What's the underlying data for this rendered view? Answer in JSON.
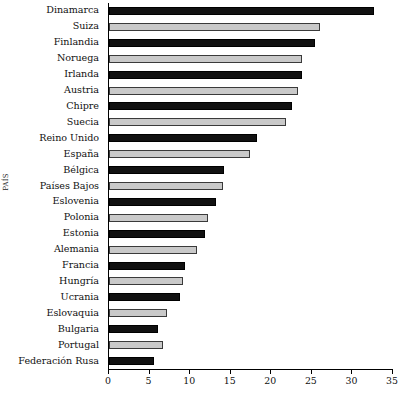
{
  "chart_data": {
    "type": "bar",
    "orientation": "horizontal",
    "title": "",
    "xlabel": "",
    "ylabel": "PAÍS",
    "xlim": [
      0,
      35
    ],
    "ylim": null,
    "grid": false,
    "legend": null,
    "xticks": [
      0,
      5,
      10,
      15,
      20,
      25,
      30,
      35
    ],
    "xtick_labels": [
      "0",
      "5",
      "10",
      "15",
      "20",
      "25",
      "30",
      "35"
    ],
    "categories": [
      "Dinamarca",
      "Suiza",
      "Finlandia",
      "Noruega",
      "Irlanda",
      "Austria",
      "Chipre",
      "Suecia",
      "Reino Unido",
      "España",
      "Bélgica",
      "Países Bajos",
      "Eslovenia",
      "Polonia",
      "Estonia",
      "Alemania",
      "Francia",
      "Hungría",
      "Ucrania",
      "Eslovaquia",
      "Bulgaria",
      "Portugal",
      "Federación Rusa"
    ],
    "values": [
      32.7,
      26.0,
      25.4,
      23.8,
      23.8,
      23.3,
      22.5,
      21.8,
      18.3,
      17.4,
      14.2,
      14.1,
      13.2,
      12.2,
      11.8,
      10.8,
      9.4,
      9.1,
      8.7,
      7.1,
      6.0,
      6.7,
      5.5
    ],
    "bar_colors": [
      "dark",
      "light",
      "dark",
      "light",
      "dark",
      "light",
      "dark",
      "light",
      "dark",
      "light",
      "dark",
      "light",
      "dark",
      "light",
      "dark",
      "light",
      "dark",
      "light",
      "dark",
      "light",
      "dark",
      "light",
      "dark"
    ],
    "colors": {
      "dark": "#111111",
      "light": "#c9c9c9",
      "axis": "#000000",
      "background": "#ffffff"
    }
  }
}
